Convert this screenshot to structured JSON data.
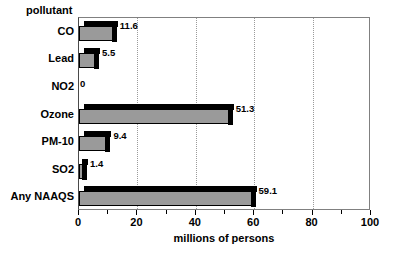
{
  "chart_data": {
    "type": "bar",
    "orientation": "horizontal",
    "title": "",
    "categories": [
      "CO",
      "Lead",
      "NO2",
      "Ozone",
      "PM-10",
      "SO2",
      "Any NAAQS"
    ],
    "values": [
      11.6,
      5.5,
      0,
      51.3,
      9.4,
      1.4,
      59.1
    ],
    "value_labels": [
      "11.6",
      "5.5",
      "0",
      "51.3",
      "9.4",
      "1.4",
      "59.1"
    ],
    "xlabel": "millions of persons",
    "ylabel": "pollutant",
    "xlim": [
      0,
      100
    ],
    "xticks": [
      0,
      20,
      40,
      60,
      80,
      100
    ],
    "xtick_labels": [
      "0",
      "20",
      "40",
      "60",
      "80",
      "100"
    ],
    "xminor_ticks": [
      10,
      30,
      50,
      70,
      90
    ],
    "gridlines": [
      20,
      40,
      60,
      80
    ],
    "grid": true,
    "legend": false,
    "bar_fill_color": "#9a9a9a",
    "bar_edge_color": "#000000",
    "bar_depth_color": "#000000",
    "background_color": "#ffffff"
  }
}
